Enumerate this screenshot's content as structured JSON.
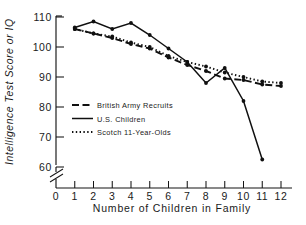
{
  "chart_data": {
    "type": "line",
    "title": "",
    "xlabel": "Number of Children in Family",
    "ylabel": "Intelligence Test Score or IQ",
    "xlim": [
      0,
      12
    ],
    "ylim": [
      58,
      110
    ],
    "grid": false,
    "axis_break": true,
    "legend_position": "center-left",
    "xticks": [
      "0",
      "1",
      "2",
      "3",
      "4",
      "5",
      "6",
      "7",
      "8",
      "9",
      "10",
      "11",
      "12"
    ],
    "yticks": [
      "60",
      "70",
      "80",
      "90",
      "100",
      "110"
    ],
    "series": [
      {
        "name": "British Army Recruits",
        "style": "dashed",
        "x": [
          1,
          2,
          3,
          4,
          5,
          6,
          7,
          8,
          9,
          10,
          11,
          12
        ],
        "values": [
          106.0,
          104.5,
          103.0,
          101.0,
          99.5,
          96.5,
          94.0,
          92.0,
          89.5,
          89.0,
          87.5,
          87.0
        ]
      },
      {
        "name": "U.S. Children",
        "style": "solid",
        "x": [
          1,
          2,
          3,
          4,
          5,
          6,
          7,
          8,
          9,
          10,
          11
        ],
        "values": [
          106.5,
          108.5,
          106.0,
          108.0,
          104.0,
          99.5,
          95.0,
          88.0,
          93.0,
          82.0,
          62.5
        ]
      },
      {
        "name": "Scotch 11-Year-Olds",
        "style": "dotted",
        "x": [
          1,
          2,
          3,
          4,
          5,
          6,
          7,
          8,
          9,
          10,
          11,
          12
        ],
        "values": [
          106.0,
          104.5,
          103.5,
          101.5,
          100.0,
          97.0,
          95.0,
          93.5,
          91.5,
          90.0,
          88.5,
          88.0
        ]
      }
    ]
  },
  "legend": {
    "entries": [
      {
        "label": "British Army Recruits",
        "style": "dashed"
      },
      {
        "label": "U.S. Children",
        "style": "solid"
      },
      {
        "label": "Scotch 11-Year-Olds",
        "style": "dotted"
      }
    ]
  },
  "axes": {
    "y_title": "Intelligence Test Score or IQ",
    "x_title": "Number of Children in Family",
    "y_labels": [
      "110",
      "100",
      "90",
      "80",
      "70",
      "60"
    ],
    "x_labels": [
      "0",
      "1",
      "2",
      "3",
      "4",
      "5",
      "6",
      "7",
      "8",
      "9",
      "10",
      "11",
      "12"
    ]
  }
}
